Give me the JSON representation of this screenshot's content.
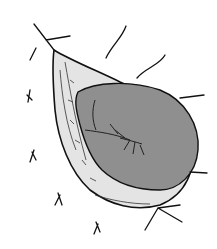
{
  "figure": {
    "kind": "anatomical line illustration",
    "colors": {
      "background": "#ffffff",
      "ink": "#111111",
      "mass_fill": "#8f8f8f",
      "sac_fill": "#e4e4e4"
    }
  }
}
